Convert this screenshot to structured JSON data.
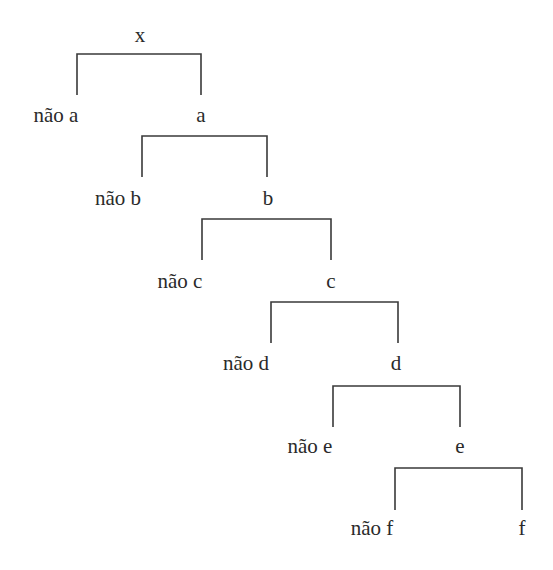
{
  "diagram": {
    "type": "binary-decision-tree",
    "root": {
      "label": "x",
      "x": 140,
      "y": 42
    },
    "levels": [
      {
        "left_label": "não a",
        "right_label": "a",
        "left_x": 77,
        "right_x": 201,
        "bar_y": 54,
        "drop_y": 95,
        "label_y": 122,
        "left_text_x": 56,
        "right_text_x": 201
      },
      {
        "left_label": "não b",
        "right_label": "b",
        "left_x": 142,
        "right_x": 267,
        "bar_y": 136,
        "drop_y": 177,
        "label_y": 205,
        "left_text_x": 118,
        "right_text_x": 268
      },
      {
        "left_label": "não c",
        "right_label": "c",
        "left_x": 202,
        "right_x": 331,
        "bar_y": 219,
        "drop_y": 260,
        "label_y": 288,
        "left_text_x": 180,
        "right_text_x": 331
      },
      {
        "left_label": "não d",
        "right_label": "d",
        "left_x": 271,
        "right_x": 398,
        "bar_y": 302,
        "drop_y": 343,
        "label_y": 370,
        "left_text_x": 246,
        "right_text_x": 396
      },
      {
        "left_label": "não e",
        "right_label": "e",
        "left_x": 333,
        "right_x": 460,
        "bar_y": 386,
        "drop_y": 427,
        "label_y": 453,
        "left_text_x": 310,
        "right_text_x": 460
      },
      {
        "left_label": "não f",
        "right_label": "f",
        "left_x": 395,
        "right_x": 522,
        "bar_y": 468,
        "drop_y": 510,
        "label_y": 535,
        "left_text_x": 372,
        "right_text_x": 522
      }
    ]
  }
}
